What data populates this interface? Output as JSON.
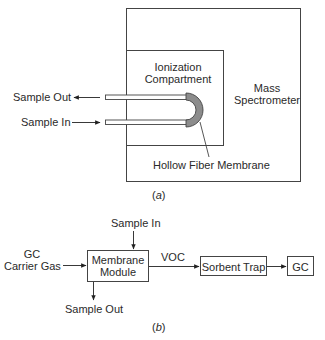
{
  "figure_a": {
    "mass_spectrometer_label_1": "Mass",
    "mass_spectrometer_label_2": "Spectrometer",
    "ionization_label_1": "Ionization",
    "ionization_label_2": "Compartment",
    "sample_out_label": "Sample Out",
    "sample_in_label": "Sample In",
    "membrane_label": "Hollow Fiber Membrane",
    "caption_open": "(",
    "caption_letter": "a",
    "caption_close": ")"
  },
  "figure_b": {
    "sample_in_label": "Sample In",
    "carrier_gas_label_1": "GC",
    "carrier_gas_label_2": "Carrier Gas",
    "membrane_module_label_1": "Membrane",
    "membrane_module_label_2": "Module",
    "voc_label": "VOC",
    "sorbent_trap_label": "Sorbent Trap",
    "gc_label": "GC",
    "sample_out_label": "Sample Out",
    "caption_open": "(",
    "caption_letter": "b",
    "caption_close": ")"
  },
  "colors": {
    "line": "#333333",
    "membrane_fill": "#8c8c8c"
  }
}
